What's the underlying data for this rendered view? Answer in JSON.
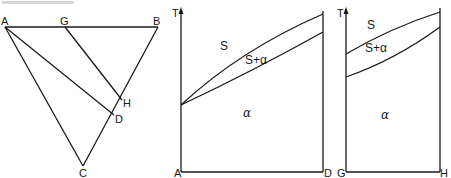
{
  "figure": {
    "type": "ternary-section-with-phase-diagrams",
    "colors": {
      "ink": "#1a1a1a",
      "background": "#ffffff"
    },
    "triangle": {
      "vertices": {
        "A": "A",
        "B": "B",
        "C": "C"
      },
      "points_on_edges": {
        "G": "G",
        "H": "H",
        "D": "D"
      },
      "lines": [
        "A-B",
        "B-C",
        "C-A",
        "A-D",
        "G-H"
      ]
    },
    "section_AD": {
      "y_axis_label": "T",
      "x_start_label": "A",
      "x_end_label": "D",
      "regions": {
        "liquid": "S",
        "two_phase": "S+α",
        "solid": "α"
      }
    },
    "section_GH": {
      "y_axis_label": "T",
      "x_start_label": "G",
      "x_end_label": "H",
      "regions": {
        "liquid": "S",
        "two_phase": "S+α",
        "solid": "α"
      }
    }
  }
}
